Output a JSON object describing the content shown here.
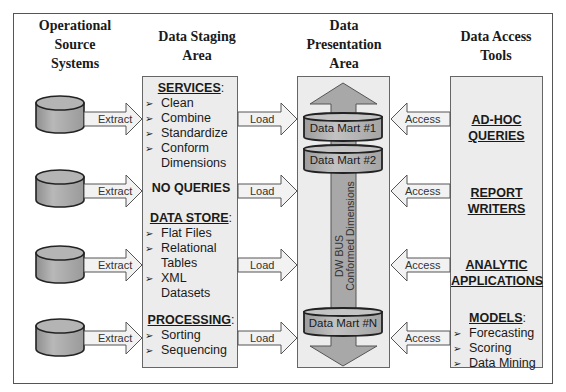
{
  "columns": {
    "source": {
      "title_lines": [
        "Operational",
        "Source",
        "Systems"
      ]
    },
    "staging": {
      "title_lines": [
        "Data Staging",
        "Area"
      ]
    },
    "presentation": {
      "title_lines": [
        "Data",
        "Presentation",
        "Area"
      ]
    },
    "access": {
      "title_lines": [
        "Data Access",
        "Tools"
      ]
    }
  },
  "staging_box": {
    "services": {
      "heading": "SERVICES",
      "items": [
        "Clean",
        "Combine",
        "Standardize",
        "Conform",
        "Dimensions"
      ]
    },
    "no_queries": "NO QUERIES",
    "data_store": {
      "heading": "DATA STORE",
      "items": [
        "Flat Files",
        "Relational",
        "Tables",
        "XML",
        "Datasets"
      ]
    },
    "processing": {
      "heading": "PROCESSING",
      "items": [
        "Sorting",
        "Sequencing"
      ]
    },
    "colon": ":",
    "bullet_glyph": "➢"
  },
  "arrows": {
    "extract_label": "Extract",
    "load_label": "Load",
    "access_label": "Access"
  },
  "presentation_box": {
    "marts": [
      "Data Mart #1",
      "Data Mart #2",
      "Data Mart #N"
    ],
    "bus_line1": "DW BUS",
    "bus_line2": "Conformed Dimensions"
  },
  "access_box": {
    "tools": [
      {
        "line1": "AD-HOC",
        "line2": "QUERIES"
      },
      {
        "line1": "REPORT",
        "line2": "WRITERS"
      },
      {
        "line1": "ANALYTIC",
        "line2": "APPLICATIONS"
      }
    ],
    "models": {
      "heading": "MODELS",
      "items": [
        "Forecasting",
        "Scoring",
        "Data Mining"
      ]
    }
  },
  "colors": {
    "frame_border": "#555555",
    "box_fill": "#ececec",
    "cylinder_fill": "#a9a9a9",
    "mart_fill": "#b0b0b0",
    "bus_fill": "#a6a6a6",
    "arrow_fill": "#f0f0f0"
  }
}
